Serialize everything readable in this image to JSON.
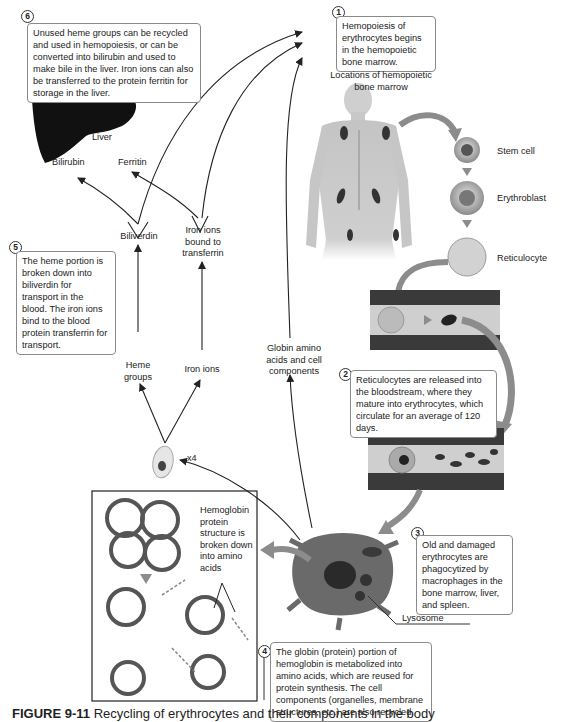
{
  "steps": [
    {
      "number": "1",
      "text": "Hemopoiesis of erythrocytes begins in the hemopoietic bone marrow."
    },
    {
      "number": "2",
      "text": "Reticulocytes are released into the bloodstream, where they mature into erythrocytes, which circulate for an average of 120 days."
    },
    {
      "number": "3",
      "text": "Old and damaged erythrocytes are phagocytized by macrophages in the bone marrow, liver, and spleen."
    },
    {
      "number": "4",
      "text": "The globin (protein) portion of hemoglobin is metabolized into amino acids, which are reused for protein synthesis. The cell components (organelles, membrane structures, etc.) are also recycled."
    },
    {
      "number": "5",
      "text": "The heme portion is broken down into biliverdin for transport in the blood. The iron ions bind to the blood protein transferrin for transport."
    },
    {
      "number": "6",
      "text": "Unused heme groups can be recycled and used in hemopoiesis, or can be converted into bilirubin and used to make bile in the liver. Iron ions can also be transferred to the protein ferritin for storage in the liver."
    }
  ],
  "labels": {
    "bone_marrow_locations": "Locations of hemopoietic bone marrow",
    "stem_cell": "Stem cell",
    "erythroblast": "Erythroblast",
    "reticulocyte": "Reticulocyte",
    "liver": "Liver",
    "bilirubin": "Bilirubin",
    "ferritin": "Ferritin",
    "biliverdin": "Biliverdin",
    "iron_bound": "Iron ions bound to transferrin",
    "heme_groups": "Heme groups",
    "iron_ions": "Iron ions",
    "globin": "Globin amino acids and cell components",
    "x4": "x4",
    "hemoglobin_breakdown": "Hemoglobin protein structure is broken down into amino acids",
    "lysosome": "Lysosome"
  },
  "caption": {
    "figure": "FIGURE 9-11",
    "text": "Recycling of erythrocytes and their components in the body"
  },
  "colors": {
    "stroke": "#222222",
    "callout_border": "#8a8a8a",
    "gray_arrow": "#8c8c8c",
    "vessel_dark": "#3a3a3a",
    "vessel_light": "#cfcfcf",
    "body": "#c9c9c9"
  }
}
